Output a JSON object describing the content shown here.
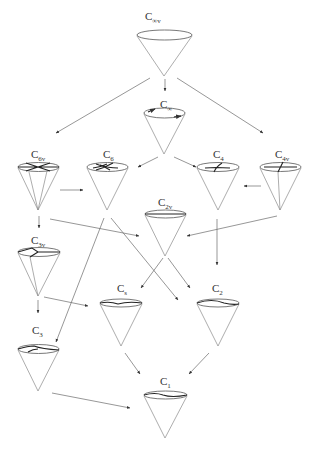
{
  "nodes": [
    {
      "id": "cinfv",
      "label": "C",
      "sub": "∞v",
      "x": 158,
      "y": 58,
      "marks": "none"
    },
    {
      "id": "cinf",
      "label": "C",
      "sub": "∞",
      "x": 165,
      "y": 125,
      "marks": "rotation"
    },
    {
      "id": "c6v",
      "label": "C",
      "sub": "6v",
      "x": 38,
      "y": 168,
      "marks": "six-mirror"
    },
    {
      "id": "c6",
      "label": "C",
      "sub": "6",
      "x": 107,
      "y": 168,
      "marks": "six-fold"
    },
    {
      "id": "c4",
      "label": "C",
      "sub": "4",
      "x": 218,
      "y": 168,
      "marks": "four-fold"
    },
    {
      "id": "c4v",
      "label": "C",
      "sub": "4v",
      "x": 281,
      "y": 168,
      "marks": "four-mirror"
    },
    {
      "id": "c2v",
      "label": "C",
      "sub": "2v",
      "x": 164,
      "y": 215,
      "marks": "two-mirror"
    },
    {
      "id": "c3v",
      "label": "C",
      "sub": "3v",
      "x": 38,
      "y": 232,
      "marks": "three-mirror"
    },
    {
      "id": "cs",
      "label": "C",
      "sub": "s",
      "x": 121,
      "y": 305,
      "marks": "mirror"
    },
    {
      "id": "c2",
      "label": "C",
      "sub": "2",
      "x": 217,
      "y": 305,
      "marks": "two-fold"
    },
    {
      "id": "c3",
      "label": "C",
      "sub": "3",
      "x": 38,
      "y": 353,
      "marks": "three-fold"
    },
    {
      "id": "c1",
      "label": "C",
      "sub": "1",
      "x": 164,
      "y": 396,
      "marks": "none-wave"
    }
  ],
  "edges": [
    {
      "from": "cinfv",
      "to": "c6v"
    },
    {
      "from": "cinfv",
      "to": "cinf"
    },
    {
      "from": "cinfv",
      "to": "c4v"
    },
    {
      "from": "cinf",
      "to": "c6"
    },
    {
      "from": "cinf",
      "to": "c4"
    },
    {
      "from": "c6v",
      "to": "c6"
    },
    {
      "from": "c4v",
      "to": "c4"
    },
    {
      "from": "c6v",
      "to": "c2v"
    },
    {
      "from": "c4v",
      "to": "c2v"
    },
    {
      "from": "c6v",
      "to": "c3v"
    },
    {
      "from": "c6",
      "to": "c3"
    },
    {
      "from": "c6",
      "to": "c2"
    },
    {
      "from": "c4",
      "to": "c2"
    },
    {
      "from": "c2v",
      "to": "cs"
    },
    {
      "from": "c2v",
      "to": "c2"
    },
    {
      "from": "c3v",
      "to": "cs"
    },
    {
      "from": "c3v",
      "to": "c3"
    },
    {
      "from": "cs",
      "to": "c1"
    },
    {
      "from": "c2",
      "to": "c1"
    },
    {
      "from": "c3",
      "to": "c1"
    }
  ]
}
